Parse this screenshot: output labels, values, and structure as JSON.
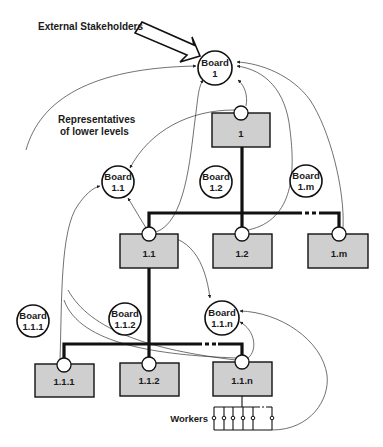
{
  "diagram": {
    "annotations": {
      "external_stakeholders": "External Stakeholders",
      "representatives_line1": "Representatives",
      "representatives_line2": "of lower levels",
      "workers": "Workers"
    },
    "boards": [
      {
        "id": "board-1",
        "line1": "Board",
        "line2": "1"
      },
      {
        "id": "board-1-1",
        "line1": "Board",
        "line2": "1.1"
      },
      {
        "id": "board-1-2",
        "line1": "Board",
        "line2": "1.2"
      },
      {
        "id": "board-1-m",
        "line1": "Board",
        "line2": "1.m"
      },
      {
        "id": "board-1-1-1",
        "line1": "Board",
        "line2": "1.1.1"
      },
      {
        "id": "board-1-1-2",
        "line1": "Board",
        "line2": "1.1.2"
      },
      {
        "id": "board-1-1-n",
        "line1": "Board",
        "line2": "1.1.n"
      }
    ],
    "units": [
      {
        "id": "unit-1",
        "label": "1"
      },
      {
        "id": "unit-1-1",
        "label": "1.1"
      },
      {
        "id": "unit-1-2",
        "label": "1.2"
      },
      {
        "id": "unit-1-m",
        "label": "1.m"
      },
      {
        "id": "unit-1-1-1",
        "label": "1.1.1"
      },
      {
        "id": "unit-1-1-2",
        "label": "1.1.2"
      },
      {
        "id": "unit-1-1-n",
        "label": "1.1.n"
      }
    ],
    "colors": {
      "unit_fill": "#cfcfcf",
      "board_fill": "#ffffff",
      "stroke": "#111111"
    }
  }
}
